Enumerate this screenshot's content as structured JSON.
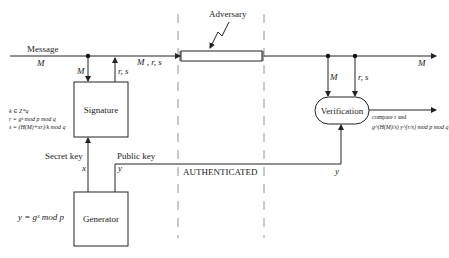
{
  "diagram": {
    "labels": {
      "message": "Message",
      "message_var": "M",
      "sig_in_M": "M",
      "sig_out_rs": "r, s",
      "channel_in": "M , r, s",
      "adversary": "Adversary",
      "out_M": "M",
      "ver_in_M": "M",
      "ver_in_rs": "r, s",
      "secret_key": "Secret key",
      "secret_key_var": "x",
      "public_key": "Public key",
      "public_key_var": "y",
      "public_key_var_right": "y",
      "authenticated": "AUTHENTICATED"
    },
    "boxes": {
      "signature": "Signature",
      "generator": "Generator",
      "verification": "Verification"
    },
    "formulas": {
      "sig_k": "k ∈ Z*q",
      "sig_r": "r = gᵏ mod p mod q",
      "sig_s": "s = (H(M)+xr)/k mod q",
      "gen_y": "y = gˣ mod p",
      "ver_line1": "compare r and",
      "ver_line2": "g^(H(M)/s) y^(r/s) mod p mod q"
    },
    "colors": {
      "stroke": "#222222",
      "dashed": "#777777",
      "background": "#ffffff"
    }
  }
}
